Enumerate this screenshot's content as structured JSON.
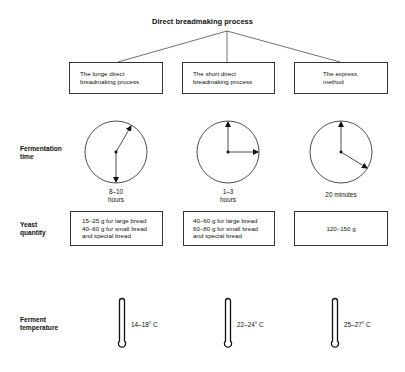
{
  "title": "Direct breadmaking process",
  "methods": [
    {
      "name": "The longe direct breadmaking process",
      "name_line1": "The longe direct",
      "name_line2": "breadmaking process",
      "fermentation_time_line1": "8–10",
      "fermentation_time_line2": "hours",
      "yeast_lines": [
        "15–25 g for large bread",
        "40–60 g for small bread",
        "and special bread"
      ],
      "temperature": "14–18° C"
    },
    {
      "name": "The short direct breadmaking process",
      "name_line1": "The short direct",
      "name_line2": "breadmaking process",
      "fermentation_time_line1": "1–3",
      "fermentation_time_line2": "hours",
      "yeast_lines": [
        "40–60 g for large bread",
        "60–80 g for small bread",
        "and special bread"
      ],
      "temperature": "22–24° C"
    },
    {
      "name": "The express method",
      "name_line1": "The express",
      "name_line2": "method",
      "fermentation_time_line1": "20 minutes",
      "fermentation_time_line2": "",
      "yeast_lines": [
        "120–150 g"
      ],
      "temperature": "25–27° C"
    }
  ],
  "row_labels": {
    "fermentation_line1": "Fermentation",
    "fermentation_line2": "time",
    "yeast_line1": "Yeast",
    "yeast_line2": "quantity",
    "temperature_line1": "Ferment",
    "temperature_line2": "temperature"
  },
  "icons": [
    "clock-icon",
    "thermometer-icon"
  ]
}
